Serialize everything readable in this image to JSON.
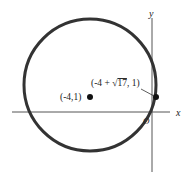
{
  "diagram": {
    "type": "circle-on-axes",
    "axes": {
      "x_label": "x",
      "y_label": "y",
      "origin_label": "O"
    },
    "center": {
      "label": "(-4,1)"
    },
    "intersection_point": {
      "label_prefix": "(-4 + ",
      "sqrt_arg": "17",
      "label_suffix": ", 1)"
    },
    "colors": {
      "circle": "#333333",
      "axes": "#555555",
      "points": "#111111"
    }
  }
}
